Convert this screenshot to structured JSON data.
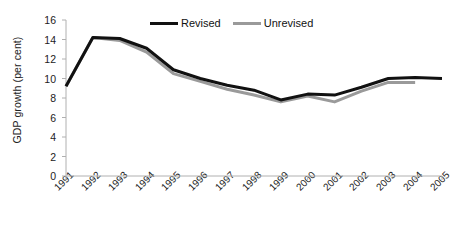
{
  "chart_data": {
    "type": "line",
    "title": "",
    "xlabel": "",
    "ylabel": "GDP growth (per cent)",
    "categories": [
      "1991",
      "1992",
      "1993",
      "1994",
      "1995",
      "1996",
      "1997",
      "1998",
      "1999",
      "2000",
      "2001",
      "2002",
      "2003",
      "2004",
      "2005"
    ],
    "ylim": [
      0,
      16
    ],
    "yticks": [
      0,
      2,
      4,
      6,
      8,
      10,
      12,
      14,
      16
    ],
    "ytick_labels": [
      "0",
      "2",
      "4",
      "6",
      "8",
      "10",
      "12",
      "14",
      "16"
    ],
    "grid": false,
    "legend_position": "top-center",
    "series": [
      {
        "name": "Revised",
        "color": "#111111",
        "width": 3,
        "values": [
          9.2,
          14.2,
          14.1,
          13.1,
          10.9,
          10.0,
          9.3,
          8.8,
          7.8,
          8.4,
          8.3,
          9.1,
          10.0,
          10.1,
          10.0
        ]
      },
      {
        "name": "Unrevised",
        "color": "#9a9a9a",
        "width": 3,
        "values": [
          9.2,
          14.2,
          13.9,
          12.7,
          10.5,
          9.7,
          8.9,
          8.3,
          7.6,
          8.2,
          7.6,
          8.7,
          9.6,
          9.6,
          null
        ]
      }
    ]
  },
  "axis": {
    "line_color": "#b0b0b0",
    "tick_color": "#b0b0b0"
  }
}
